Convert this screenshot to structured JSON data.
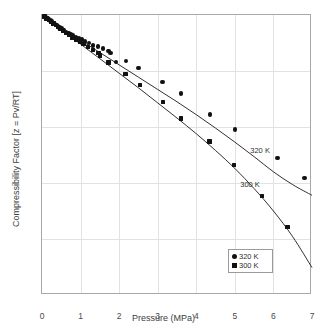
{
  "chart_data": {
    "type": "scatter",
    "title": "",
    "xlabel": "Pressure (MPa)",
    "ylabel": "Compressibility Factor [z = Pv/RT]",
    "xlim": [
      0,
      7
    ],
    "ylim": [
      0.5,
      1
    ],
    "xticks": [
      "0",
      "1",
      "2",
      "3",
      "4",
      "5",
      "6",
      "7"
    ],
    "yticks": [
      "1",
      "0.9",
      "0.8",
      "0.7",
      "0.6",
      "0.5"
    ],
    "grid": true,
    "legend_position": "bottom-right",
    "series": [
      {
        "name": "320 K",
        "marker": "circle",
        "color": "#111111",
        "inline_label": "320 K",
        "points": [
          [
            0.05,
            0.998
          ],
          [
            0.1,
            0.996
          ],
          [
            0.14,
            0.994
          ],
          [
            0.18,
            0.992
          ],
          [
            0.22,
            0.99
          ],
          [
            0.26,
            0.988
          ],
          [
            0.3,
            0.986
          ],
          [
            0.34,
            0.984
          ],
          [
            0.38,
            0.982
          ],
          [
            0.42,
            0.98
          ],
          [
            0.46,
            0.978
          ],
          [
            0.5,
            0.976
          ],
          [
            0.56,
            0.973
          ],
          [
            0.62,
            0.97
          ],
          [
            0.68,
            0.968
          ],
          [
            0.74,
            0.966
          ],
          [
            0.8,
            0.963
          ],
          [
            0.88,
            0.96
          ],
          [
            0.96,
            0.958
          ],
          [
            1.04,
            0.956
          ],
          [
            1.12,
            0.953
          ],
          [
            1.22,
            0.95
          ],
          [
            1.32,
            0.946
          ],
          [
            1.45,
            0.944
          ],
          [
            1.58,
            0.94
          ],
          [
            1.72,
            0.936
          ],
          [
            1.78,
            0.932
          ],
          [
            1.92,
            0.916
          ],
          [
            2.18,
            0.918
          ],
          [
            2.5,
            0.905
          ],
          [
            3.12,
            0.88
          ],
          [
            3.6,
            0.86
          ],
          [
            4.36,
            0.822
          ],
          [
            5.0,
            0.796
          ],
          [
            6.1,
            0.745
          ],
          [
            6.8,
            0.709
          ]
        ],
        "curve": [
          [
            0.0,
            1.0
          ],
          [
            0.5,
            0.977
          ],
          [
            1.0,
            0.955
          ],
          [
            1.5,
            0.933
          ],
          [
            2.0,
            0.911
          ],
          [
            2.5,
            0.889
          ],
          [
            3.0,
            0.867
          ],
          [
            3.5,
            0.845
          ],
          [
            4.0,
            0.822
          ],
          [
            4.5,
            0.798
          ],
          [
            5.0,
            0.773
          ],
          [
            5.5,
            0.747
          ],
          [
            6.0,
            0.72
          ],
          [
            6.5,
            0.697
          ],
          [
            7.0,
            0.678
          ]
        ]
      },
      {
        "name": "300 K",
        "marker": "square",
        "color": "#111111",
        "inline_label": "300 K",
        "points": [
          [
            0.06,
            0.997
          ],
          [
            0.12,
            0.994
          ],
          [
            0.18,
            0.991
          ],
          [
            0.24,
            0.988
          ],
          [
            0.3,
            0.985
          ],
          [
            0.36,
            0.982
          ],
          [
            0.42,
            0.979
          ],
          [
            0.48,
            0.975
          ],
          [
            0.54,
            0.972
          ],
          [
            0.62,
            0.968
          ],
          [
            0.7,
            0.964
          ],
          [
            0.78,
            0.96
          ],
          [
            0.88,
            0.956
          ],
          [
            0.98,
            0.952
          ],
          [
            1.08,
            0.948
          ],
          [
            1.2,
            0.943
          ],
          [
            1.32,
            0.938
          ],
          [
            1.46,
            0.932
          ],
          [
            1.5,
            0.928
          ],
          [
            1.72,
            0.915
          ],
          [
            2.16,
            0.895
          ],
          [
            2.54,
            0.875
          ],
          [
            3.14,
            0.845
          ],
          [
            3.6,
            0.815
          ],
          [
            4.34,
            0.774
          ],
          [
            4.98,
            0.732
          ],
          [
            5.7,
            0.677
          ],
          [
            6.36,
            0.621
          ]
        ],
        "curve": [
          [
            0.0,
            1.0
          ],
          [
            0.5,
            0.974
          ],
          [
            1.0,
            0.948
          ],
          [
            1.5,
            0.922
          ],
          [
            2.0,
            0.896
          ],
          [
            2.5,
            0.87
          ],
          [
            3.0,
            0.843
          ],
          [
            3.5,
            0.816
          ],
          [
            4.0,
            0.788
          ],
          [
            4.5,
            0.758
          ],
          [
            5.0,
            0.726
          ],
          [
            5.5,
            0.69
          ],
          [
            6.0,
            0.65
          ],
          [
            6.5,
            0.604
          ],
          [
            7.0,
            0.549
          ]
        ]
      }
    ],
    "annotations": [
      {
        "text": "320 K",
        "x": 5.4,
        "y": 0.757
      },
      {
        "text": "300 K",
        "x": 5.14,
        "y": 0.697
      }
    ]
  },
  "legend": {
    "entries": [
      {
        "label": "320 K",
        "marker": "circle"
      },
      {
        "label": "300 K",
        "marker": "square"
      }
    ]
  },
  "caption": {
    "text": ""
  }
}
